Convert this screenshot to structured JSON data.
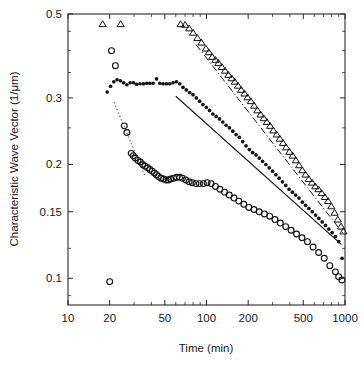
{
  "chart_data": {
    "type": "scatter",
    "title": "",
    "xlabel": "Time (min)",
    "ylabel": "Characteristic Wave Vector (1/μm)",
    "xscale": "log",
    "yscale": "log",
    "xlim": [
      10,
      1000
    ],
    "ylim": [
      0.085,
      0.5
    ],
    "grid": false,
    "legend_position": "none",
    "xticks": [
      10,
      20,
      50,
      100,
      200,
      500,
      1000
    ],
    "xticklabels": [
      "10",
      "20",
      "50",
      "100",
      "200",
      "500",
      "1000"
    ],
    "yticks": [
      0.1,
      0.15,
      0.2,
      0.3,
      0.5
    ],
    "yticklabels": [
      "0.1",
      "0.15",
      "0.2",
      "0.3",
      "0.5"
    ],
    "series": [
      {
        "name": "open-circles",
        "marker": "open-circle",
        "points": [
          [
            20.0,
            0.098
          ],
          [
            20.6,
            0.4
          ],
          [
            22.0,
            0.365
          ],
          [
            25.5,
            0.253
          ],
          [
            26.6,
            0.243
          ],
          [
            28.6,
            0.214
          ],
          [
            29.6,
            0.211
          ],
          [
            30.6,
            0.208
          ],
          [
            32.0,
            0.205
          ],
          [
            33.3,
            0.203
          ],
          [
            34.6,
            0.2
          ],
          [
            36.0,
            0.198
          ],
          [
            37.5,
            0.196
          ],
          [
            39.0,
            0.194
          ],
          [
            40.5,
            0.192
          ],
          [
            42.0,
            0.19
          ],
          [
            43.5,
            0.188
          ],
          [
            45.0,
            0.186
          ],
          [
            47.0,
            0.184
          ],
          [
            49.0,
            0.183
          ],
          [
            51.0,
            0.182
          ],
          [
            53.0,
            0.182
          ],
          [
            55.0,
            0.183
          ],
          [
            58.0,
            0.184
          ],
          [
            61.0,
            0.185
          ],
          [
            64.0,
            0.185
          ],
          [
            67.0,
            0.184
          ],
          [
            71.0,
            0.182
          ],
          [
            75.0,
            0.18
          ],
          [
            79.0,
            0.179
          ],
          [
            84.0,
            0.178
          ],
          [
            89.0,
            0.178
          ],
          [
            95.0,
            0.178
          ],
          [
            101.0,
            0.179
          ],
          [
            108.0,
            0.178
          ],
          [
            116.0,
            0.175
          ],
          [
            125.0,
            0.172
          ],
          [
            135.0,
            0.169
          ],
          [
            146.0,
            0.166
          ],
          [
            158.0,
            0.163
          ],
          [
            171.0,
            0.16
          ],
          [
            186.0,
            0.157
          ],
          [
            202.0,
            0.154
          ],
          [
            220.0,
            0.152
          ],
          [
            240.0,
            0.15
          ],
          [
            262.0,
            0.148
          ],
          [
            286.0,
            0.146
          ],
          [
            312.0,
            0.143
          ],
          [
            341.0,
            0.14
          ],
          [
            373.0,
            0.137
          ],
          [
            408.0,
            0.134
          ],
          [
            447.0,
            0.131
          ],
          [
            489.0,
            0.128
          ],
          [
            536.0,
            0.125
          ],
          [
            588.0,
            0.121
          ],
          [
            645.0,
            0.117
          ],
          [
            708.0,
            0.113
          ],
          [
            777.0,
            0.108
          ],
          [
            853.0,
            0.104
          ],
          [
            900.0,
            0.101
          ],
          [
            950.0,
            0.099
          ]
        ]
      },
      {
        "name": "filled-circles",
        "marker": "filled-circle",
        "points": [
          [
            19.2,
            0.311
          ],
          [
            20.3,
            0.322
          ],
          [
            21.4,
            0.331
          ],
          [
            22.6,
            0.335
          ],
          [
            23.9,
            0.333
          ],
          [
            25.2,
            0.329
          ],
          [
            26.6,
            0.325
          ],
          [
            28.1,
            0.329
          ],
          [
            29.7,
            0.329
          ],
          [
            31.3,
            0.326
          ],
          [
            33.1,
            0.327
          ],
          [
            35.0,
            0.327
          ],
          [
            37.0,
            0.328
          ],
          [
            39.0,
            0.328
          ],
          [
            41.2,
            0.328
          ],
          [
            43.6,
            0.337
          ],
          [
            46.0,
            0.328
          ],
          [
            48.6,
            0.327
          ],
          [
            51.4,
            0.327
          ],
          [
            54.3,
            0.327
          ],
          [
            57.4,
            0.329
          ],
          [
            60.6,
            0.331
          ],
          [
            64.1,
            0.327
          ],
          [
            67.7,
            0.32
          ],
          [
            71.5,
            0.315
          ],
          [
            75.6,
            0.31
          ],
          [
            79.9,
            0.306
          ],
          [
            84.4,
            0.3
          ],
          [
            89.2,
            0.294
          ],
          [
            94.2,
            0.288
          ],
          [
            99.6,
            0.283
          ],
          [
            105.2,
            0.278
          ],
          [
            111.2,
            0.272
          ],
          [
            117.5,
            0.268
          ],
          [
            124.1,
            0.264
          ],
          [
            131.2,
            0.259
          ],
          [
            138.6,
            0.254
          ],
          [
            146.5,
            0.25
          ],
          [
            154.8,
            0.245
          ],
          [
            163.5,
            0.24
          ],
          [
            172.8,
            0.236
          ],
          [
            182.6,
            0.23
          ],
          [
            192.9,
            0.224
          ],
          [
            203.8,
            0.219
          ],
          [
            215.4,
            0.215
          ],
          [
            227.6,
            0.212
          ],
          [
            240.4,
            0.208
          ],
          [
            254.0,
            0.204
          ],
          [
            268.4,
            0.2
          ],
          [
            283.6,
            0.196
          ],
          [
            299.7,
            0.192
          ],
          [
            316.7,
            0.188
          ],
          [
            334.6,
            0.184
          ],
          [
            353.5,
            0.18
          ],
          [
            373.6,
            0.176
          ],
          [
            394.7,
            0.172
          ],
          [
            417.1,
            0.169
          ],
          [
            440.7,
            0.166
          ],
          [
            465.6,
            0.163
          ],
          [
            492.0,
            0.159
          ],
          [
            519.8,
            0.156
          ],
          [
            549.2,
            0.153
          ],
          [
            580.3,
            0.15
          ],
          [
            613.1,
            0.147
          ],
          [
            647.8,
            0.144
          ],
          [
            684.5,
            0.141
          ],
          [
            723.2,
            0.138
          ],
          [
            764.1,
            0.135
          ],
          [
            807.3,
            0.132
          ],
          [
            853.0,
            0.129
          ],
          [
            901.3,
            0.125
          ],
          [
            952.3,
            0.113
          ]
        ]
      },
      {
        "name": "open-triangles",
        "marker": "open-triangle",
        "points": [
          [
            17.8,
            0.47
          ],
          [
            24.0,
            0.47
          ],
          [
            65.0,
            0.47
          ],
          [
            70.0,
            0.468
          ],
          [
            75.0,
            0.458
          ],
          [
            80.0,
            0.446
          ],
          [
            86.0,
            0.432
          ],
          [
            92.0,
            0.42
          ],
          [
            99.0,
            0.405
          ],
          [
            104.0,
            0.396
          ],
          [
            110.0,
            0.385
          ],
          [
            116.0,
            0.378
          ],
          [
            122.0,
            0.371
          ],
          [
            129.0,
            0.362
          ],
          [
            136.0,
            0.354
          ],
          [
            144.0,
            0.345
          ],
          [
            152.0,
            0.338
          ],
          [
            160.0,
            0.331
          ],
          [
            169.0,
            0.323
          ],
          [
            178.0,
            0.315
          ],
          [
            188.0,
            0.308
          ],
          [
            198.0,
            0.301
          ],
          [
            209.0,
            0.294
          ],
          [
            221.0,
            0.286
          ],
          [
            233.0,
            0.278
          ],
          [
            246.0,
            0.271
          ],
          [
            259.0,
            0.265
          ],
          [
            273.0,
            0.259
          ],
          [
            288.0,
            0.253
          ],
          [
            304.0,
            0.246
          ],
          [
            321.0,
            0.24
          ],
          [
            338.0,
            0.234
          ],
          [
            357.0,
            0.228
          ],
          [
            376.0,
            0.222
          ],
          [
            397.0,
            0.216
          ],
          [
            419.0,
            0.211
          ],
          [
            442.0,
            0.205
          ],
          [
            466.0,
            0.199
          ],
          [
            492.0,
            0.193
          ],
          [
            519.0,
            0.188
          ],
          [
            548.0,
            0.183
          ],
          [
            578.0,
            0.179
          ],
          [
            610.0,
            0.175
          ],
          [
            643.0,
            0.172
          ],
          [
            678.0,
            0.168
          ],
          [
            716.0,
            0.164
          ],
          [
            755.0,
            0.16
          ],
          [
            797.0,
            0.155
          ],
          [
            841.0,
            0.149
          ],
          [
            887.0,
            0.143
          ],
          [
            936.0,
            0.137
          ],
          [
            975.0,
            0.133
          ]
        ]
      }
    ],
    "fit_lines": [
      {
        "name": "dotted-fit-open-circles",
        "style": "dotted",
        "x": [
          21.5,
          36.0
        ],
        "y": [
          0.292,
          0.186
        ]
      },
      {
        "name": "solid-fit-filled-circles",
        "style": "solid",
        "x": [
          60.0,
          940.0
        ],
        "y": [
          0.303,
          0.123
        ]
      },
      {
        "name": "dashdot-fit-open-triangles",
        "style": "dash-dot",
        "x": [
          84.0,
          960.0
        ],
        "y": [
          0.415,
          0.132
        ]
      }
    ]
  },
  "axes": {
    "x_title": "Time (min)",
    "y_title": "Characteristic Wave Vector (1/μm)"
  },
  "colors": {
    "marker": "#141414",
    "axis": "#2a2a2a",
    "background": "#ffffff"
  }
}
